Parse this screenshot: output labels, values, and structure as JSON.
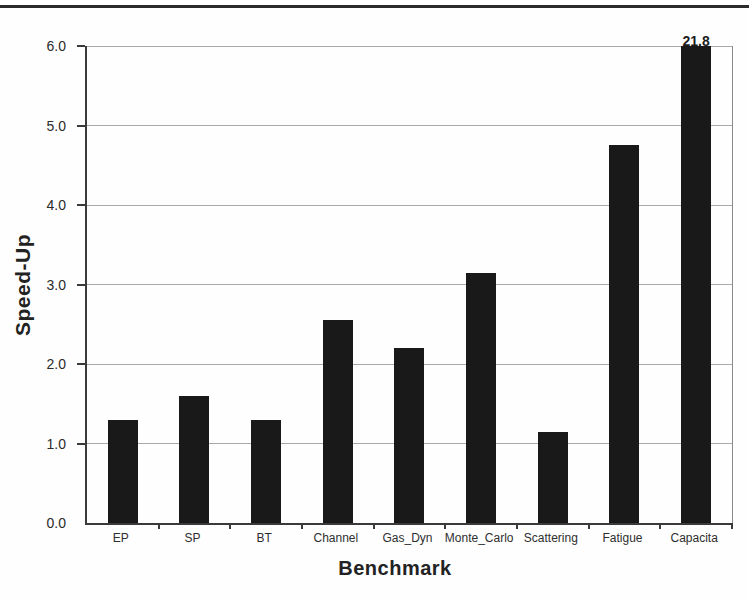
{
  "page": {
    "background": "#fefefe",
    "top_rule_color": "#2b2b2b"
  },
  "chart_data": {
    "type": "bar",
    "title": "",
    "xlabel": "Benchmark",
    "ylabel": "Speed-Up",
    "categories": [
      "EP",
      "SP",
      "BT",
      "Channel",
      "Gas_Dyn",
      "Monte_Carlo",
      "Scattering",
      "Fatigue",
      "Capacita"
    ],
    "values": [
      1.3,
      1.6,
      1.3,
      2.55,
      2.2,
      3.15,
      1.15,
      4.75,
      21.8
    ],
    "ylim": [
      0,
      6
    ],
    "ytick_labels": [
      "0.0",
      "1.0",
      "2.0",
      "3.0",
      "4.0",
      "5.0",
      "6.0"
    ],
    "grid": true,
    "legend": "none",
    "bar_color": "#191919",
    "annotations": [
      {
        "category": "Capacita",
        "text": "21.8"
      }
    ]
  }
}
